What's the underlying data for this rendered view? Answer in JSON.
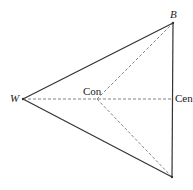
{
  "diagram": {
    "type": "triangle-with-interior-point",
    "vertices": {
      "W": {
        "label": "W",
        "x": 23,
        "y": 99
      },
      "B": {
        "label": "B",
        "x": 173,
        "y": 23
      },
      "C": {
        "label": "",
        "x": 172,
        "y": 177
      }
    },
    "points": {
      "Con": {
        "label": "Con",
        "x": 97,
        "y": 99
      },
      "Cen": {
        "label": "Cen",
        "x": 173,
        "y": 99
      }
    },
    "solid_edges": [
      [
        "W",
        "B"
      ],
      [
        "B",
        "C"
      ],
      [
        "W",
        "C"
      ]
    ],
    "dashed_edges": [
      [
        "W",
        "Cen"
      ],
      [
        "Con",
        "B"
      ],
      [
        "Con",
        "C"
      ]
    ],
    "colors": {
      "solid_line": "#333333",
      "dashed_line": "#777777",
      "text": "#1a1a1a"
    }
  }
}
